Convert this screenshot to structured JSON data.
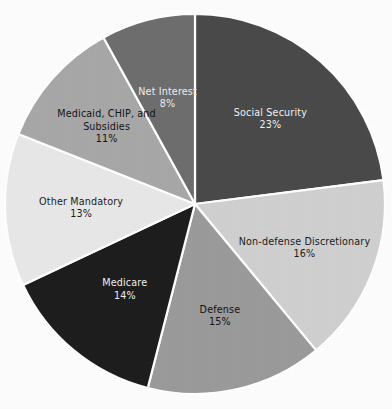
{
  "chart_data": {
    "type": "pie",
    "title": "",
    "subtitle": "",
    "xlabel": "",
    "ylabel": "",
    "legend_position": "none",
    "grid": false,
    "labels_inside_slices": true,
    "start_angle_deg": 0,
    "direction": "clockwise",
    "categories": [
      "Social Security",
      "Non-defense Discretionary",
      "Defense",
      "Medicare",
      "Other Mandatory",
      "Medicaid, CHIP, and Subsidies",
      "Net Interest"
    ],
    "values": [
      23,
      16,
      15,
      14,
      13,
      11,
      8
    ],
    "value_labels": [
      "23%",
      "16%",
      "15%",
      "14%",
      "13%",
      "11%",
      "8%"
    ],
    "units": "percent",
    "total": 100,
    "colors": [
      "#4a4a4a",
      "#d0d0d0",
      "#9b9b9b",
      "#1e1e1e",
      "#e8e8e8",
      "#a8a8a8",
      "#6e6e6e"
    ],
    "slices": [
      {
        "name": "Social Security",
        "name_lines": [
          "Social Security"
        ],
        "value": 23,
        "value_label": "23%",
        "color": "#4a4a4a",
        "text_color": "#f2f2f2"
      },
      {
        "name": "Non-defense Discretionary",
        "name_lines": [
          "Non-defense Discretionary"
        ],
        "value": 16,
        "value_label": "16%",
        "color": "#d0d0d0",
        "text_color": "#1c1c1c"
      },
      {
        "name": "Defense",
        "name_lines": [
          "Defense"
        ],
        "value": 15,
        "value_label": "15%",
        "color": "#9b9b9b",
        "text_color": "#141414"
      },
      {
        "name": "Medicare",
        "name_lines": [
          "Medicare"
        ],
        "value": 14,
        "value_label": "14%",
        "color": "#1e1e1e",
        "text_color": "#f0f0f0"
      },
      {
        "name": "Other Mandatory",
        "name_lines": [
          "Other Mandatory"
        ],
        "value": 13,
        "value_label": "13%",
        "color": "#e8e8e8",
        "text_color": "#1c1c1c"
      },
      {
        "name": "Medicaid, CHIP, and Subsidies",
        "name_lines": [
          "Medicaid, CHIP, and",
          "Subsidies"
        ],
        "value": 11,
        "value_label": "11%",
        "color": "#a8a8a8",
        "text_color": "#151515"
      },
      {
        "name": "Net Interest",
        "name_lines": [
          "Net Interest"
        ],
        "value": 8,
        "value_label": "8%",
        "color": "#6e6e6e",
        "text_color": "#efefef"
      }
    ],
    "geometry": {
      "center_x": 195,
      "center_y": 204,
      "radius": 190,
      "separator_color": "#ffffff"
    },
    "background_color": "#fdfdfd"
  }
}
